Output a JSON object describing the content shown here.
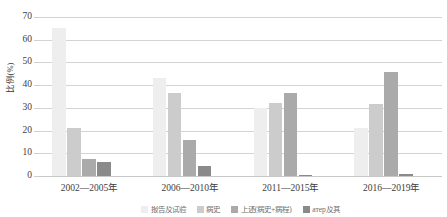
{
  "chart_data": {
    "type": "bar",
    "title": "",
    "xlabel": "",
    "ylabel": "比例(%)",
    "ylim": [
      0,
      70
    ],
    "ytick_step": 10,
    "yticks": [
      70,
      60,
      50,
      40,
      30,
      20,
      10,
      0
    ],
    "grid": true,
    "legend_position": "bottom",
    "categories": [
      "2002—2005年",
      "2006—2010年",
      "2011—2015年",
      "2016—2019年"
    ],
    "series": [
      {
        "name": "报告及试验",
        "color": "#eeeeee",
        "values": [
          65,
          43,
          30,
          21
        ]
      },
      {
        "name": "病史",
        "color": "#cccccc",
        "values": [
          21,
          36.5,
          32,
          31.5
        ]
      },
      {
        "name": "上述(病史+病程)",
        "color": "#aaaaaa",
        "values": [
          7.5,
          16,
          36.5,
          46
        ]
      },
      {
        "name": "атер及其",
        "color": "#8a8a8a",
        "values": [
          6,
          4.5,
          0.5,
          1
        ]
      }
    ]
  },
  "axes": {
    "y_axis_title": "比例(%)",
    "y_tick_labels": [
      "70",
      "60",
      "50",
      "40",
      "30",
      "20",
      "10",
      "0"
    ],
    "x_tick_labels": [
      "2002—2005年",
      "2006—2010年",
      "2011—2015年",
      "2016—2019年"
    ]
  },
  "legend": {
    "items": [
      {
        "label": "报告及试验",
        "color": "#eeeeee"
      },
      {
        "label": "病史",
        "color": "#cccccc"
      },
      {
        "label": "上述(病史+病程)",
        "color": "#aaaaaa"
      },
      {
        "label": "атер及其",
        "color": "#8a8a8a"
      }
    ]
  },
  "colors": {
    "gridline": "#d4d4d4",
    "baseline": "#c8c8c8",
    "text": "#3d3d3d",
    "background": "#ffffff"
  }
}
